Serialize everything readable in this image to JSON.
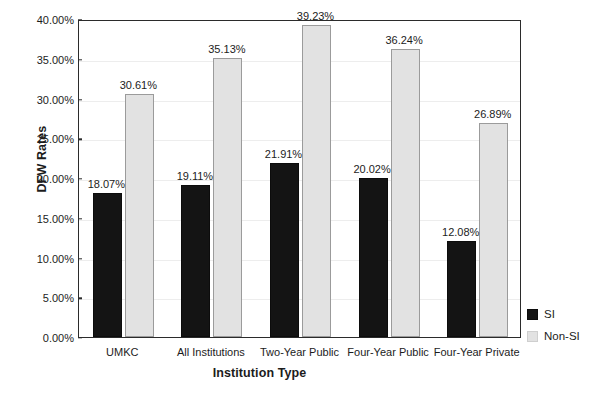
{
  "chart_data": {
    "type": "bar",
    "title": "",
    "xlabel": "Institution Type",
    "ylabel": "DFW Rates",
    "categories": [
      "UMKC",
      "All Institutions",
      "Two-Year Public",
      "Four-Year Public",
      "Four-Year Private"
    ],
    "series": [
      {
        "name": "SI",
        "color": "#141414",
        "values": [
          18.07,
          19.11,
          21.91,
          20.02,
          12.08
        ],
        "labels": [
          "18.07%",
          "19.11%",
          "21.91%",
          "20.02%",
          "12.08%"
        ]
      },
      {
        "name": "Non-SI",
        "color": "#e2e2e2",
        "values": [
          30.61,
          35.13,
          39.23,
          36.24,
          26.89
        ],
        "labels": [
          "30.61%",
          "35.13%",
          "39.23%",
          "36.24%",
          "26.89%"
        ]
      }
    ],
    "ylim": [
      0,
      40
    ],
    "ytick_values": [
      0,
      5,
      10,
      15,
      20,
      25,
      30,
      35,
      40
    ],
    "ytick_labels": [
      "0.00%",
      "5.00%",
      "10.00%",
      "15.00%",
      "20.00%",
      "25.00%",
      "30.00%",
      "35.00%",
      "40.00%"
    ],
    "grid": true,
    "legend_position": "right",
    "legend_entries": [
      "SI",
      "Non-SI"
    ]
  }
}
